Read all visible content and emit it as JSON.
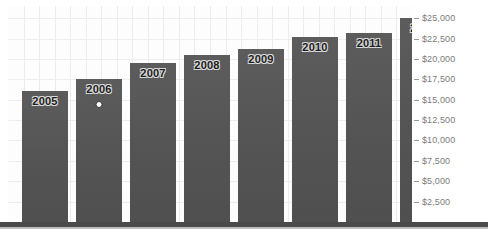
{
  "chart_data": {
    "type": "bar",
    "title": "",
    "subtitle": "",
    "xlabel": "",
    "ylabel": "",
    "categories": [
      "2005",
      "2006",
      "2007",
      "2008",
      "2009",
      "2010",
      "2011",
      "2012"
    ],
    "values": [
      16100,
      17600,
      19500,
      20500,
      21200,
      22700,
      23200,
      25000
    ],
    "series": [
      {
        "name": "Amount",
        "values": [
          16100,
          17600,
          19500,
          20500,
          21200,
          22700,
          23200,
          25000
        ]
      }
    ],
    "bar_labels": [
      "2005",
      "2006",
      "2007",
      "2008",
      "2009",
      "2010",
      "2011",
      "2012"
    ],
    "ylim": [
      0,
      26500
    ],
    "ytick_values": [
      25000,
      22500,
      20000,
      17500,
      15000,
      12500,
      10000,
      7500,
      5000,
      2500
    ],
    "ytick_labels": [
      "$25,000",
      "$22,500",
      "$20,000",
      "$17,500",
      "$15,000",
      "$12,500",
      "$10,000",
      "$7,500",
      "$5,000",
      "$2,500"
    ],
    "axis_position": "right",
    "grid": true,
    "grid_orientation": "both",
    "legend": false,
    "legend_position": "none",
    "annotations": [
      {
        "name": "marker-dot",
        "category": "2006",
        "shape": "circle"
      }
    ],
    "colors": {
      "bar": "#585858",
      "bar_label_text": "#1c1c1c",
      "bar_label_outline": "#d8d8d8",
      "baseline": "#4a4a4a",
      "grid": "#ececed",
      "tick_label": "#7b7b7b",
      "plot_background": "#fdfdfd",
      "page_background": "#ffffff"
    }
  }
}
